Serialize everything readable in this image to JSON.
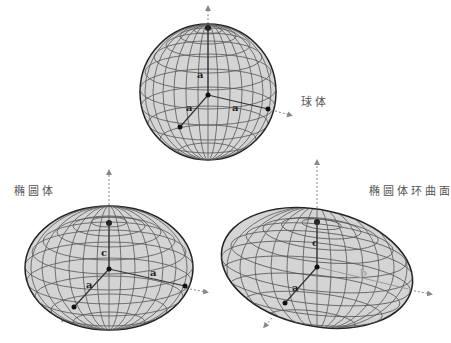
{
  "labels": {
    "sphere": "球体",
    "ellipsoid": "椭圆体",
    "spheroid": "椭圆体环曲面"
  },
  "symbols": {
    "a": "a",
    "b": "b",
    "c": "c"
  },
  "colors": {
    "fill": "#d4d4d4",
    "grid": "#555555",
    "outline": "#222222",
    "axis": "#888888"
  }
}
